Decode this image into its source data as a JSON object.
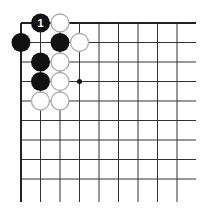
{
  "board": {
    "title": "Go corner diagram",
    "origin_x": 21,
    "origin_y": 23,
    "spacing": 19.5,
    "cols": 9,
    "rows": 9,
    "line_end_x": 196,
    "line_end_y": 202,
    "line_color": "#333333",
    "edge_color": "#222222",
    "black_color": "#111111",
    "white_fill": "#ffffff",
    "white_stroke": "#aaaaaa",
    "star_points": [
      [
        3,
        3
      ]
    ],
    "stones": [
      {
        "col": 1,
        "row": 0,
        "color": "black",
        "label": "1"
      },
      {
        "col": 2,
        "row": 0,
        "color": "white",
        "label": ""
      },
      {
        "col": 0,
        "row": 1,
        "color": "black",
        "label": ""
      },
      {
        "col": 2,
        "row": 1,
        "color": "black",
        "label": ""
      },
      {
        "col": 3,
        "row": 1,
        "color": "white",
        "label": ""
      },
      {
        "col": 1,
        "row": 2,
        "color": "black",
        "label": ""
      },
      {
        "col": 2,
        "row": 2,
        "color": "white",
        "label": ""
      },
      {
        "col": 1,
        "row": 3,
        "color": "black",
        "label": ""
      },
      {
        "col": 2,
        "row": 3,
        "color": "white",
        "label": ""
      },
      {
        "col": 1,
        "row": 4,
        "color": "white",
        "label": ""
      },
      {
        "col": 2,
        "row": 4,
        "color": "white",
        "label": ""
      }
    ]
  }
}
